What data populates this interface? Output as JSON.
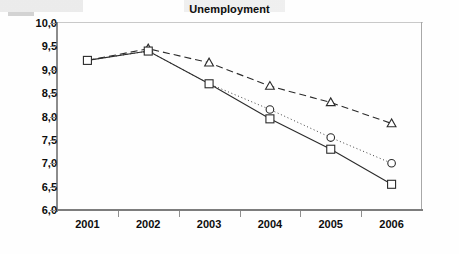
{
  "chart_data": {
    "type": "line",
    "title": "Unemployment",
    "xlabel": "",
    "ylabel": "",
    "x": [
      "2001",
      "2002",
      "2003",
      "2004",
      "2005",
      "2006"
    ],
    "categories": [
      "2001",
      "2002",
      "2003",
      "2004",
      "2005",
      "2006"
    ],
    "ylim": [
      6.0,
      10.0
    ],
    "ytick_labels": [
      "10,0",
      "9,5",
      "9,0",
      "8,5",
      "8,0",
      "7,5",
      "7,0",
      "6,5",
      "6,0"
    ],
    "ytick_values": [
      10.0,
      9.5,
      9.0,
      8.5,
      8.0,
      7.5,
      7.0,
      6.5,
      6.0
    ],
    "grid": false,
    "legend": "none",
    "series": [
      {
        "name": "dashed-triangle-series",
        "marker": "triangle",
        "line_style": "dashed",
        "values": [
          9.2,
          9.45,
          9.15,
          8.65,
          8.3,
          7.85
        ],
        "labels": [
          "9,2",
          "9,45",
          "9,15",
          "8,65",
          "8,3",
          "7,85"
        ]
      },
      {
        "name": "dotted-circle-series",
        "marker": "circle",
        "line_style": "dotted",
        "values": [
          9.2,
          9.4,
          8.7,
          8.15,
          7.55,
          7.0
        ],
        "labels": [
          "9,2",
          "9,4",
          "8,7",
          "8,15",
          "7,55",
          "7,0"
        ]
      },
      {
        "name": "solid-square-series",
        "marker": "square",
        "line_style": "solid",
        "values": [
          9.2,
          9.4,
          8.7,
          7.95,
          7.3,
          6.55
        ],
        "labels": [
          "9,2",
          "9,4",
          "8,7",
          "7,95",
          "7,3",
          "6,55"
        ]
      }
    ],
    "colors": {
      "line": "#2b2b2b",
      "marker_fill": "#ffffff",
      "axis": "#8c8c8c",
      "text": "#0d0d0d"
    }
  }
}
